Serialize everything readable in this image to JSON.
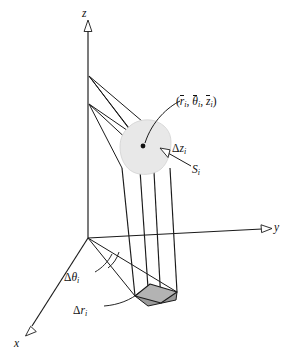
{
  "figure": {
    "kind": "cylindrical-coordinate-volume-element-diagram",
    "background_color": "#ffffff",
    "ink_color": "#1a1a1a",
    "blob_fill": "#e8e8e8",
    "base_fill": "#b3b3b3"
  },
  "axes": {
    "z": {
      "label": "z",
      "direction": "up",
      "arrowhead": "hollow-triangle"
    },
    "y": {
      "label": "y",
      "direction": "right",
      "arrowhead": "hollow-triangle"
    },
    "x": {
      "label": "x",
      "direction": "down-left",
      "arrowhead": "hollow-triangle"
    }
  },
  "labels": {
    "sample_point": {
      "open_paren": "(",
      "r": "r",
      "comma1": ", ",
      "theta": "θ",
      "comma2": ", ",
      "z": "z",
      "close_paren": ")",
      "subscript": "i",
      "plain": "(r̄i, θ̄i, z̄i)"
    },
    "delta_z": {
      "delta": "Δ",
      "var": "z",
      "subscript": "i",
      "plain": "Δzi"
    },
    "surface": {
      "var": "S",
      "subscript": "i",
      "plain": "Si"
    },
    "delta_theta": {
      "delta": "Δ",
      "var": "θ",
      "subscript": "i",
      "plain": "Δθi"
    },
    "delta_r": {
      "delta": "Δ",
      "var": "r",
      "subscript": "i",
      "plain": "Δri"
    }
  },
  "elements": {
    "sample_point_dot": "filled-black-dot",
    "blob_region": "irregular-rounded-polygon-cross-section",
    "column": "four-vertical-edges-prism",
    "base_patch": "filled-gray-parallelogram",
    "angle_arc": "small-arc-at-origin",
    "radial_rays": "rays-from-z-axis-to-blob-corners"
  }
}
